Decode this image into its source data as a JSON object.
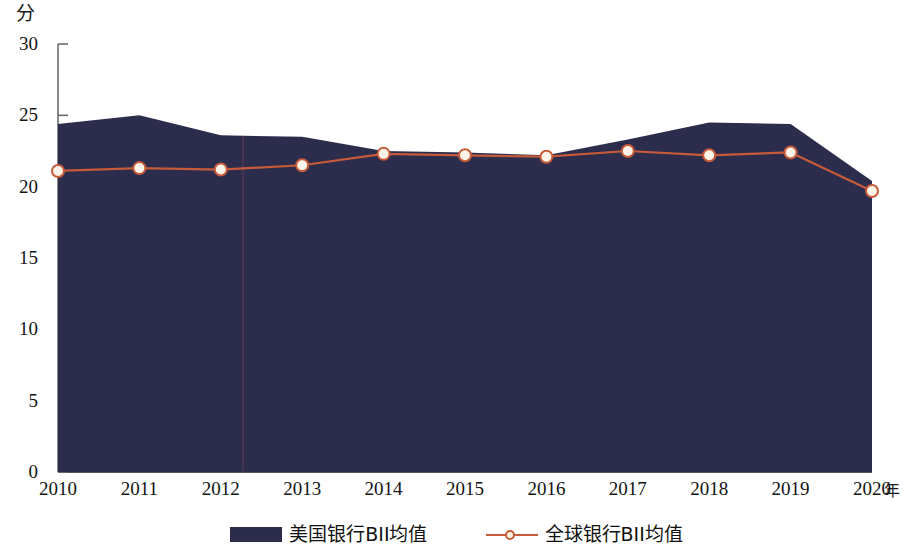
{
  "chart_data": {
    "type": "area",
    "title": "",
    "xlabel": "年",
    "ylabel": "分",
    "x": [
      2010,
      2011,
      2012,
      2013,
      2014,
      2015,
      2016,
      2017,
      2018,
      2019,
      2020
    ],
    "categories": [
      "2010",
      "2011",
      "2012",
      "2013",
      "2014",
      "2015",
      "2016",
      "2017",
      "2018",
      "2019",
      "2020"
    ],
    "ylim": [
      0,
      30
    ],
    "xlim": [
      2010,
      2020
    ],
    "yticks": [
      0,
      5,
      10,
      15,
      20,
      25,
      30
    ],
    "ytick_labels": [
      "0",
      "5",
      "10",
      "15",
      "20",
      "25",
      "30"
    ],
    "grid": false,
    "legend_position": "bottom",
    "series": [
      {
        "name": "美国银行BII均值",
        "type": "area",
        "color": "#2c2c4d",
        "values": [
          24.4,
          25.0,
          23.6,
          23.5,
          22.5,
          22.4,
          22.2,
          23.3,
          24.5,
          24.4,
          20.4
        ]
      },
      {
        "name": "全球银行BII均值",
        "type": "line",
        "color": "#c75b39",
        "marker": "circle-open",
        "marker_fill": "#fdf3e6",
        "values": [
          21.1,
          21.3,
          21.2,
          21.5,
          22.3,
          22.2,
          22.1,
          22.5,
          22.2,
          22.4,
          19.7
        ]
      }
    ]
  },
  "axes": {
    "y_unit_label": "分",
    "x_unit_label": "年"
  },
  "legend": {
    "items": [
      {
        "label": "美国银行BII均值",
        "swatch": "area-swatch",
        "color": "#2c2c4d"
      },
      {
        "label": "全球银行BII均值",
        "swatch": "line-marker-swatch",
        "color": "#c75b39"
      }
    ]
  },
  "colors": {
    "area_navy": "#2c2c4d",
    "line_orange": "#c75b39",
    "marker_fill": "#fdf3e6",
    "axis": "#6b6b6b",
    "background": "#ffffff"
  }
}
